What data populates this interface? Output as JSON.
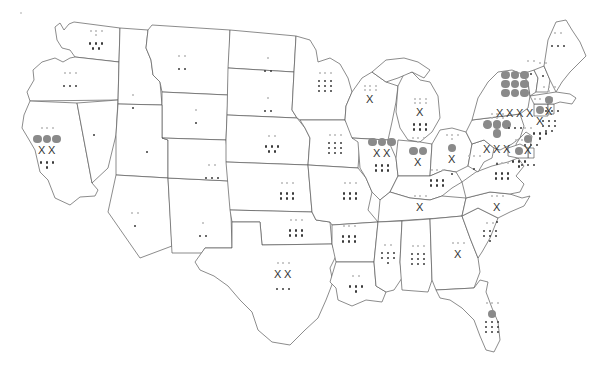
{
  "map": {
    "title": "United States state marker map",
    "description": "Outline map of the contiguous United States with tally markers plotted inside each state",
    "width": 607,
    "height": 371,
    "background_color": "#ffffff",
    "outline_color": "#5a5a5a"
  },
  "legend": {
    "symbols": [
      {
        "name": "large-circle",
        "glyph": "circle",
        "color": "#8a8a8a",
        "size_px": 9
      },
      {
        "name": "cross-mark",
        "glyph": "X",
        "color": "#333333",
        "size_px": 11
      },
      {
        "name": "dark-dot",
        "glyph": "dot",
        "color": "#3a3a3a",
        "size_px": 3
      },
      {
        "name": "light-dot",
        "glyph": "dot",
        "color": "#b9b9b9",
        "size_px": 2
      }
    ]
  },
  "states": [
    {
      "code": "WA",
      "name": "Washington",
      "cx": 96,
      "cy": 45,
      "big_circles": 0,
      "crosses": 0,
      "dark_dots": 5,
      "light_dots": 4
    },
    {
      "code": "OR",
      "name": "Oregon",
      "cx": 70,
      "cy": 85,
      "big_circles": 0,
      "crosses": 0,
      "dark_dots": 3,
      "light_dots": 3
    },
    {
      "code": "CA",
      "name": "California",
      "cx": 47,
      "cy": 140,
      "big_circles": 3,
      "crosses": 2,
      "dark_dots": 4,
      "light_dots": 3
    },
    {
      "code": "NV",
      "name": "Nevada",
      "cx": 94,
      "cy": 143,
      "big_circles": 0,
      "crosses": 0,
      "dark_dots": 1,
      "light_dots": 0
    },
    {
      "code": "ID",
      "name": "Idaho",
      "cx": 133,
      "cy": 107,
      "big_circles": 0,
      "crosses": 0,
      "dark_dots": 1,
      "light_dots": 1
    },
    {
      "code": "MT",
      "name": "Montana",
      "cx": 182,
      "cy": 68,
      "big_circles": 0,
      "crosses": 0,
      "dark_dots": 2,
      "light_dots": 2
    },
    {
      "code": "WY",
      "name": "Wyoming",
      "cx": 196,
      "cy": 122,
      "big_circles": 0,
      "crosses": 0,
      "dark_dots": 1,
      "light_dots": 1
    },
    {
      "code": "UT",
      "name": "Utah",
      "cx": 147,
      "cy": 160,
      "big_circles": 0,
      "crosses": 0,
      "dark_dots": 1,
      "light_dots": 0
    },
    {
      "code": "AZ",
      "name": "Arizona",
      "cx": 135,
      "cy": 225,
      "big_circles": 0,
      "crosses": 0,
      "dark_dots": 1,
      "light_dots": 2
    },
    {
      "code": "NM",
      "name": "New Mexico",
      "cx": 203,
      "cy": 235,
      "big_circles": 0,
      "crosses": 0,
      "dark_dots": 2,
      "light_dots": 1
    },
    {
      "code": "CO",
      "name": "Colorado",
      "cx": 212,
      "cy": 177,
      "big_circles": 0,
      "crosses": 0,
      "dark_dots": 3,
      "light_dots": 2
    },
    {
      "code": "ND",
      "name": "North Dakota",
      "cx": 268,
      "cy": 70,
      "big_circles": 0,
      "crosses": 0,
      "dark_dots": 2,
      "light_dots": 1
    },
    {
      "code": "SD",
      "name": "South Dakota",
      "cx": 268,
      "cy": 110,
      "big_circles": 0,
      "crosses": 0,
      "dark_dots": 2,
      "light_dots": 1
    },
    {
      "code": "NE",
      "name": "Nebraska",
      "cx": 272,
      "cy": 148,
      "big_circles": 0,
      "crosses": 0,
      "dark_dots": 5,
      "light_dots": 2
    },
    {
      "code": "KS",
      "name": "Kansas",
      "cx": 287,
      "cy": 195,
      "big_circles": 0,
      "crosses": 0,
      "dark_dots": 6,
      "light_dots": 3
    },
    {
      "code": "OK",
      "name": "Oklahoma",
      "cx": 296,
      "cy": 232,
      "big_circles": 0,
      "crosses": 0,
      "dark_dots": 6,
      "light_dots": 3
    },
    {
      "code": "TX",
      "name": "Texas",
      "cx": 283,
      "cy": 275,
      "big_circles": 0,
      "crosses": 2,
      "dark_dots": 3,
      "light_dots": 3
    },
    {
      "code": "MN",
      "name": "Minnesota",
      "cx": 325,
      "cy": 85,
      "big_circles": 0,
      "crosses": 0,
      "dark_dots": 9,
      "light_dots": 3
    },
    {
      "code": "IA",
      "name": "Iowa",
      "cx": 335,
      "cy": 147,
      "big_circles": 0,
      "crosses": 0,
      "dark_dots": 9,
      "light_dots": 3
    },
    {
      "code": "MO",
      "name": "Missouri",
      "cx": 350,
      "cy": 195,
      "big_circles": 0,
      "crosses": 0,
      "dark_dots": 6,
      "light_dots": 3
    },
    {
      "code": "AR",
      "name": "Arkansas",
      "cx": 349,
      "cy": 238,
      "big_circles": 0,
      "crosses": 0,
      "dark_dots": 6,
      "light_dots": 3
    },
    {
      "code": "LA",
      "name": "Louisiana",
      "cx": 356,
      "cy": 288,
      "big_circles": 0,
      "crosses": 0,
      "dark_dots": 4,
      "light_dots": 2
    },
    {
      "code": "WI",
      "name": "Wisconsin",
      "cx": 370,
      "cy": 100,
      "big_circles": 0,
      "crosses": 1,
      "dark_dots": 0,
      "light_dots": 6
    },
    {
      "code": "IL",
      "name": "Illinois",
      "cx": 382,
      "cy": 152,
      "big_circles": 3,
      "crosses": 2,
      "dark_dots": 6,
      "light_dots": 0
    },
    {
      "code": "MI",
      "name": "Michigan",
      "cx": 420,
      "cy": 113,
      "big_circles": 0,
      "crosses": 1,
      "dark_dots": 6,
      "light_dots": 6
    },
    {
      "code": "IN",
      "name": "Indiana",
      "cx": 418,
      "cy": 152,
      "big_circles": 2,
      "crosses": 1,
      "dark_dots": 0,
      "light_dots": 4
    },
    {
      "code": "OH",
      "name": "Ohio",
      "cx": 452,
      "cy": 149,
      "big_circles": 1,
      "crosses": 1,
      "dark_dots": 1,
      "light_dots": 4
    },
    {
      "code": "KY",
      "name": "Kentucky",
      "cx": 437,
      "cy": 182,
      "big_circles": 0,
      "crosses": 0,
      "dark_dots": 6,
      "light_dots": 3
    },
    {
      "code": "TN",
      "name": "Tennessee",
      "cx": 420,
      "cy": 208,
      "big_circles": 0,
      "crosses": 1,
      "dark_dots": 0,
      "light_dots": 3
    },
    {
      "code": "MS",
      "name": "Mississippi",
      "cx": 388,
      "cy": 257,
      "big_circles": 0,
      "crosses": 0,
      "dark_dots": 7,
      "light_dots": 2
    },
    {
      "code": "AL",
      "name": "Alabama",
      "cx": 418,
      "cy": 258,
      "big_circles": 0,
      "crosses": 0,
      "dark_dots": 9,
      "light_dots": 3
    },
    {
      "code": "GA",
      "name": "Georgia",
      "cx": 458,
      "cy": 255,
      "big_circles": 0,
      "crosses": 1,
      "dark_dots": 0,
      "light_dots": 3
    },
    {
      "code": "FL",
      "name": "Florida",
      "cx": 492,
      "cy": 315,
      "big_circles": 1,
      "crosses": 0,
      "dark_dots": 9,
      "light_dots": 3
    },
    {
      "code": "SC",
      "name": "South Carolina",
      "cx": 490,
      "cy": 235,
      "big_circles": 0,
      "crosses": 0,
      "dark_dots": 7,
      "light_dots": 2
    },
    {
      "code": "NC",
      "name": "North Carolina",
      "cx": 497,
      "cy": 208,
      "big_circles": 0,
      "crosses": 1,
      "dark_dots": 1,
      "light_dots": 3
    },
    {
      "code": "VA",
      "name": "Virginia",
      "cx": 502,
      "cy": 175,
      "big_circles": 0,
      "crosses": 0,
      "dark_dots": 6,
      "light_dots": 3
    },
    {
      "code": "WV",
      "name": "West Virginia",
      "cx": 474,
      "cy": 168,
      "big_circles": 0,
      "crosses": 0,
      "dark_dots": 1,
      "light_dots": 3
    },
    {
      "code": "PA",
      "name": "Pennsylvania",
      "cx": 497,
      "cy": 130,
      "big_circles": 4,
      "crosses": 3,
      "dark_dots": 1,
      "light_dots": 8
    },
    {
      "code": "NY",
      "name": "New York",
      "cx": 515,
      "cy": 85,
      "big_circles": 9,
      "crosses": 4,
      "dark_dots": 3,
      "light_dots": 2
    },
    {
      "code": "NJ",
      "name": "New Jersey",
      "cx": 528,
      "cy": 140,
      "big_circles": 1,
      "crosses": 1,
      "dark_dots": 3,
      "light_dots": 2
    },
    {
      "code": "DE",
      "name": "Delaware",
      "cx": 531,
      "cy": 153,
      "big_circles": 0,
      "crosses": 0,
      "dark_dots": 3,
      "light_dots": 0
    },
    {
      "code": "MD",
      "name": "Maryland",
      "cx": 519,
      "cy": 152,
      "big_circles": 1,
      "crosses": 0,
      "dark_dots": 4,
      "light_dots": 2
    },
    {
      "code": "CT",
      "name": "Connecticut",
      "cx": 540,
      "cy": 111,
      "big_circles": 1,
      "crosses": 1,
      "dark_dots": 4,
      "light_dots": 3
    },
    {
      "code": "RI",
      "name": "Rhode Island",
      "cx": 552,
      "cy": 110,
      "big_circles": 0,
      "crosses": 0,
      "dark_dots": 3,
      "light_dots": 1
    },
    {
      "code": "MA",
      "name": "Massachusetts",
      "cx": 549,
      "cy": 101,
      "big_circles": 1,
      "crosses": 1,
      "dark_dots": 8,
      "light_dots": 4
    },
    {
      "code": "VT",
      "name": "Vermont",
      "cx": 531,
      "cy": 73,
      "big_circles": 0,
      "crosses": 0,
      "dark_dots": 1,
      "light_dots": 2
    },
    {
      "code": "NH",
      "name": "New Hampshire",
      "cx": 543,
      "cy": 75,
      "big_circles": 0,
      "crosses": 0,
      "dark_dots": 1,
      "light_dots": 2
    },
    {
      "code": "ME",
      "name": "Maine",
      "cx": 558,
      "cy": 45,
      "big_circles": 0,
      "crosses": 0,
      "dark_dots": 3,
      "light_dots": 2
    }
  ],
  "artifacts": {
    "corner_speck": {
      "x": 20,
      "y": 12,
      "size": 2,
      "color": "#c8c8c8"
    }
  }
}
